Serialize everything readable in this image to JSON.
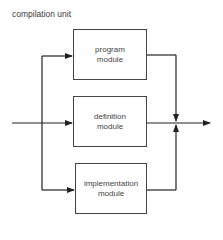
{
  "diagram": {
    "title": "compilation unit",
    "modules": [
      {
        "line1": "program",
        "line2": "module"
      },
      {
        "line1": "definition",
        "line2": "module"
      },
      {
        "line1": "implementation",
        "line2": "module"
      }
    ]
  }
}
